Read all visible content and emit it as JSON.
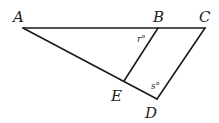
{
  "figure": {
    "type": "geometry-diagram",
    "vertices": {
      "A": "A",
      "B": "B",
      "C": "C",
      "D": "D",
      "E": "E"
    },
    "segments": [
      "AC",
      "AD",
      "CD",
      "BE"
    ],
    "angles": {
      "at_B": {
        "label": "r°",
        "between": "ABE"
      },
      "at_D": {
        "label": "s°",
        "between": "ADC"
      }
    },
    "line_color": "#1a1a1a",
    "text_color": "#222222"
  }
}
